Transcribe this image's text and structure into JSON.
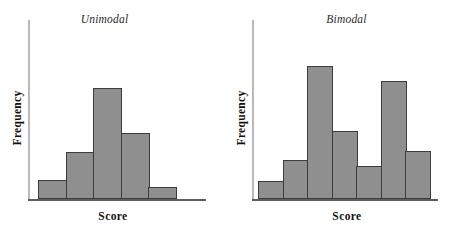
{
  "figure": {
    "background": "#ffffff",
    "bar_fill": "#8f8f8f",
    "bar_stroke": "#3c3c3c",
    "axis_color": "#5d5d5d",
    "y_axis_color": "#b9b9b9"
  },
  "panels": [
    {
      "key": "unimodal",
      "title": "Unimodal",
      "xlabel": "Score",
      "ylabel": "Frequency"
    },
    {
      "key": "bimodal",
      "title": "Bimodal",
      "xlabel": "Score",
      "ylabel": "Frequency"
    }
  ],
  "chart_data": [
    {
      "type": "bar",
      "title": "Unimodal",
      "xlabel": "Score",
      "ylabel": "Frequency",
      "categories": [
        "1",
        "2",
        "3",
        "4",
        "5"
      ],
      "values": [
        19,
        47,
        111,
        66,
        12
      ],
      "ylim": [
        0,
        180
      ],
      "grid": false,
      "legend": false,
      "tick_labels": {
        "x": [],
        "y": []
      },
      "notes": "Single peak at the third interval; frequencies rise then fall."
    },
    {
      "type": "bar",
      "title": "Bimodal",
      "xlabel": "Score",
      "ylabel": "Frequency",
      "categories": [
        "1",
        "2",
        "3",
        "4",
        "5",
        "6",
        "7"
      ],
      "values": [
        18,
        39,
        133,
        68,
        33,
        118,
        48
      ],
      "ylim": [
        0,
        180
      ],
      "grid": false,
      "legend": false,
      "tick_labels": {
        "x": [],
        "y": []
      },
      "notes": "Two peaks, at the third and sixth intervals, separated by a dip."
    }
  ]
}
